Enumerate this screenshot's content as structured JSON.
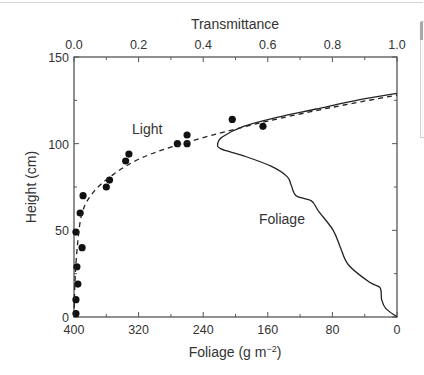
{
  "chart_data": {
    "type": "scatter",
    "title": "",
    "top_axis": {
      "label": "Transmittance",
      "ticks": [
        "0.0",
        "0.2",
        "0.4",
        "0.6",
        "0.8",
        "1.0"
      ],
      "range": [
        0,
        1.0
      ]
    },
    "bottom_axis": {
      "label": "Foliage (g m⁻²)",
      "ticks": [
        "400",
        "320",
        "240",
        "160",
        "80",
        "0"
      ],
      "range": [
        400,
        0
      ]
    },
    "left_axis": {
      "label": "Height (cm)",
      "ticks": [
        "0",
        "50",
        "100",
        "150"
      ],
      "range": [
        0,
        150
      ]
    },
    "grid": false,
    "legend": "none",
    "annotations": [
      {
        "text": "Light",
        "near": "dashed curve"
      },
      {
        "text": "Foliage",
        "near": "solid curve"
      }
    ],
    "series": [
      {
        "name": "Light (measured)",
        "style": "filled circles",
        "axis": "transmittance",
        "points": [
          {
            "x": 0.006,
            "y": 2
          },
          {
            "x": 0.006,
            "y": 10
          },
          {
            "x": 0.012,
            "y": 19
          },
          {
            "x": 0.009,
            "y": 29
          },
          {
            "x": 0.025,
            "y": 40
          },
          {
            "x": 0.006,
            "y": 49
          },
          {
            "x": 0.019,
            "y": 60
          },
          {
            "x": 0.028,
            "y": 70
          },
          {
            "x": 0.1,
            "y": 75
          },
          {
            "x": 0.11,
            "y": 79
          },
          {
            "x": 0.16,
            "y": 90
          },
          {
            "x": 0.17,
            "y": 94
          },
          {
            "x": 0.32,
            "y": 100
          },
          {
            "x": 0.35,
            "y": 100
          },
          {
            "x": 0.35,
            "y": 105
          },
          {
            "x": 0.49,
            "y": 114
          },
          {
            "x": 0.585,
            "y": 110
          }
        ]
      },
      {
        "name": "Light (model)",
        "style": "dashed line",
        "axis": "transmittance",
        "points": [
          {
            "x": 0.0,
            "y": 0
          },
          {
            "x": 0.003,
            "y": 20
          },
          {
            "x": 0.01,
            "y": 40
          },
          {
            "x": 0.025,
            "y": 60
          },
          {
            "x": 0.06,
            "y": 72
          },
          {
            "x": 0.12,
            "y": 82
          },
          {
            "x": 0.2,
            "y": 91
          },
          {
            "x": 0.3,
            "y": 98
          },
          {
            "x": 0.45,
            "y": 106
          },
          {
            "x": 0.6,
            "y": 113
          },
          {
            "x": 0.8,
            "y": 121
          },
          {
            "x": 1.0,
            "y": 128
          }
        ]
      },
      {
        "name": "Foliage",
        "style": "solid line",
        "axis": "foliage",
        "points": [
          {
            "x": 0,
            "y": 0
          },
          {
            "x": 14,
            "y": 5
          },
          {
            "x": 19,
            "y": 10
          },
          {
            "x": 21,
            "y": 17
          },
          {
            "x": 34,
            "y": 20
          },
          {
            "x": 60,
            "y": 30
          },
          {
            "x": 70,
            "y": 40
          },
          {
            "x": 79,
            "y": 50
          },
          {
            "x": 97,
            "y": 61
          },
          {
            "x": 106,
            "y": 67
          },
          {
            "x": 125,
            "y": 70
          },
          {
            "x": 131,
            "y": 76
          },
          {
            "x": 136,
            "y": 81
          },
          {
            "x": 156,
            "y": 87
          },
          {
            "x": 190,
            "y": 93
          },
          {
            "x": 218,
            "y": 97
          },
          {
            "x": 222,
            "y": 100
          },
          {
            "x": 216,
            "y": 104
          },
          {
            "x": 190,
            "y": 110
          },
          {
            "x": 150,
            "y": 115
          },
          {
            "x": 100,
            "y": 120
          },
          {
            "x": 50,
            "y": 125
          },
          {
            "x": 0,
            "y": 129
          }
        ]
      }
    ]
  },
  "labels": {
    "top_axis_title": "Transmittance",
    "bottom_axis_title_main": "Foliage (g m",
    "bottom_axis_title_sup": "−2",
    "bottom_axis_title_end": ")",
    "left_axis_title": "Height (cm)",
    "annot_light": "Light",
    "annot_foliage": "Foliage"
  }
}
